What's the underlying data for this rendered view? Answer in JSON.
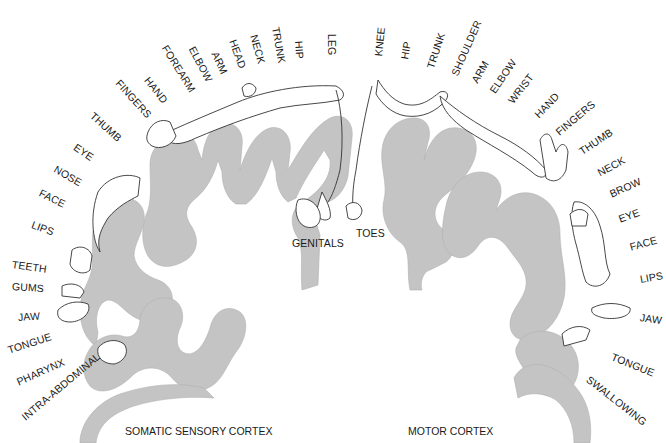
{
  "figure": {
    "left_title": "SOMATIC SENSORY CORTEX",
    "right_title": "MOTOR CORTEX",
    "cortex_fill": "#c4c4c4",
    "line_color": "#333333"
  },
  "sensory_labels": [
    {
      "text": "LEG",
      "x": 332,
      "y": 28,
      "rot": 90
    },
    {
      "text": "HIP",
      "x": 299,
      "y": 35,
      "rot": 86
    },
    {
      "text": "TRUNK",
      "x": 276,
      "y": 21,
      "rot": 80
    },
    {
      "text": "NECK",
      "x": 254,
      "y": 29,
      "rot": 74
    },
    {
      "text": "HEAD",
      "x": 233,
      "y": 34,
      "rot": 70
    },
    {
      "text": "ARM",
      "x": 215,
      "y": 46,
      "rot": 65
    },
    {
      "text": "ELBOW",
      "x": 192,
      "y": 41,
      "rot": 62
    },
    {
      "text": "FOREARM",
      "x": 165,
      "y": 40,
      "rot": 58
    },
    {
      "text": "HAND",
      "x": 147,
      "y": 72,
      "rot": 52
    },
    {
      "text": "FINGERS",
      "x": 118,
      "y": 75,
      "rot": 48
    },
    {
      "text": "THUMB",
      "x": 92,
      "y": 108,
      "rot": 42
    },
    {
      "text": "EYE",
      "x": 75,
      "y": 140,
      "rot": 34
    },
    {
      "text": "NOSE",
      "x": 55,
      "y": 162,
      "rot": 30
    },
    {
      "text": "FACE",
      "x": 40,
      "y": 186,
      "rot": 26
    },
    {
      "text": "LIPS",
      "x": 32,
      "y": 218,
      "rot": 20
    },
    {
      "text": "TEETH",
      "x": 12,
      "y": 258,
      "rot": 8
    },
    {
      "text": "GUMS",
      "x": 12,
      "y": 280,
      "rot": 4
    },
    {
      "text": "JAW",
      "x": 18,
      "y": 311,
      "rot": -4
    },
    {
      "text": "TONGUE",
      "x": 8,
      "y": 344,
      "rot": -18
    },
    {
      "text": "PHARYNX",
      "x": 17,
      "y": 376,
      "rot": -24
    },
    {
      "text": "INTRA-ABDOMINAL",
      "x": 23,
      "y": 412,
      "rot": -40
    },
    {
      "text": "GENITALS",
      "x": 292,
      "y": 243,
      "rot": 0
    }
  ],
  "motor_labels": [
    {
      "text": "TOES",
      "x": 356,
      "y": 233,
      "rot": 0
    },
    {
      "text": "KNEE",
      "x": 378,
      "y": 50,
      "rot": -84
    },
    {
      "text": "HIP",
      "x": 404,
      "y": 53,
      "rot": -80
    },
    {
      "text": "TRUNK",
      "x": 430,
      "y": 62,
      "rot": -72
    },
    {
      "text": "SHOULDER",
      "x": 454,
      "y": 69,
      "rot": -66
    },
    {
      "text": "ARM",
      "x": 474,
      "y": 76,
      "rot": -60
    },
    {
      "text": "ELBOW",
      "x": 492,
      "y": 86,
      "rot": -56
    },
    {
      "text": "WRIST",
      "x": 510,
      "y": 96,
      "rot": -52
    },
    {
      "text": "HAND",
      "x": 536,
      "y": 110,
      "rot": -46
    },
    {
      "text": "FINGERS",
      "x": 557,
      "y": 127,
      "rot": -40
    },
    {
      "text": "THUMB",
      "x": 580,
      "y": 146,
      "rot": -34
    },
    {
      "text": "NECK",
      "x": 598,
      "y": 167,
      "rot": -28
    },
    {
      "text": "BROW",
      "x": 610,
      "y": 188,
      "rot": -24
    },
    {
      "text": "EYE",
      "x": 619,
      "y": 213,
      "rot": -20
    },
    {
      "text": "FACE",
      "x": 630,
      "y": 241,
      "rot": -16
    },
    {
      "text": "LIPS",
      "x": 640,
      "y": 273,
      "rot": -10
    },
    {
      "text": "JAW",
      "x": 640,
      "y": 315,
      "rot": 8
    },
    {
      "text": "TONGUE",
      "x": 618,
      "y": 355,
      "rot": 22
    },
    {
      "text": "SWALLOWING",
      "x": 588,
      "y": 375,
      "rot": 38
    }
  ]
}
